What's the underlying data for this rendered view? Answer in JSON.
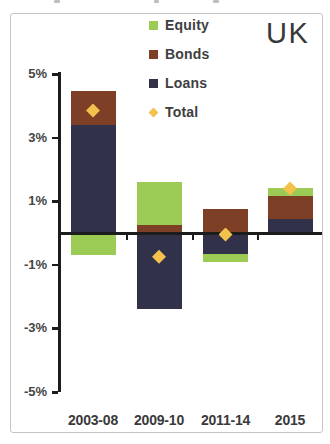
{
  "header": {
    "region_label": "UK"
  },
  "legend": {
    "items": [
      {
        "label": "Equity",
        "marker": "square",
        "color": "#9ccb55"
      },
      {
        "label": "Bonds",
        "marker": "square",
        "color": "#7d3f26"
      },
      {
        "label": "Loans",
        "marker": "square",
        "color": "#31324a"
      },
      {
        "label": "Total",
        "marker": "diamond",
        "color": "#f2c24d"
      }
    ]
  },
  "chart_data": {
    "type": "bar",
    "subtype": "stacked_bar_with_total_marker",
    "title": "UK",
    "categories": [
      "2003-08",
      "2009-10",
      "2011-14",
      "2015"
    ],
    "series": [
      {
        "name": "Loans",
        "color": "#31324a",
        "values": [
          3.4,
          -2.4,
          -0.65,
          0.45
        ]
      },
      {
        "name": "Bonds",
        "color": "#7d3f26",
        "values": [
          1.05,
          0.25,
          0.75,
          0.7
        ]
      },
      {
        "name": "Equity",
        "color": "#9ccb55",
        "values": [
          -0.7,
          1.35,
          -0.25,
          0.25
        ]
      }
    ],
    "totals": {
      "name": "Total",
      "color": "#f2c24d",
      "values": [
        3.85,
        -0.75,
        -0.05,
        1.4
      ]
    },
    "unit": "%",
    "ylim": [
      -5,
      5
    ],
    "y_ticks": [
      {
        "value": 5,
        "label": "5%"
      },
      {
        "value": 3,
        "label": "3%"
      },
      {
        "value": 1,
        "label": "1%"
      },
      {
        "value": -1,
        "label": "-1%"
      },
      {
        "value": -3,
        "label": "-3%"
      },
      {
        "value": -5,
        "label": "-5%"
      }
    ],
    "grid": false,
    "legend_position": "top-center-inside",
    "legend_order": [
      "Equity",
      "Bonds",
      "Loans",
      "Total"
    ]
  },
  "style": {
    "axis_color": "#1c1c1c",
    "label_color": "#3d3d3d",
    "panel_border_color": "#c4c4c4",
    "background": "#ffffff"
  }
}
